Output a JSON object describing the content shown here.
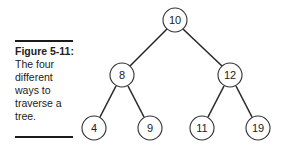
{
  "caption": {
    "label": "Figure 5-11:",
    "text": "The four different ways to traverse a tree."
  },
  "tree": {
    "nodes": [
      {
        "id": "root",
        "value": "10",
        "cx": 175,
        "cy": 20
      },
      {
        "id": "left",
        "value": "8",
        "cx": 122,
        "cy": 75
      },
      {
        "id": "right",
        "value": "12",
        "cx": 230,
        "cy": 75
      },
      {
        "id": "left-left",
        "value": "4",
        "cx": 94,
        "cy": 128
      },
      {
        "id": "left-right",
        "value": "9",
        "cx": 150,
        "cy": 128
      },
      {
        "id": "right-left",
        "value": "11",
        "cx": 202,
        "cy": 128
      },
      {
        "id": "right-right",
        "value": "19",
        "cx": 258,
        "cy": 128
      }
    ],
    "edges": [
      [
        "10",
        "8"
      ],
      [
        "10",
        "12"
      ],
      [
        "8",
        "4"
      ],
      [
        "8",
        "9"
      ],
      [
        "12",
        "11"
      ],
      [
        "12",
        "19"
      ]
    ]
  }
}
